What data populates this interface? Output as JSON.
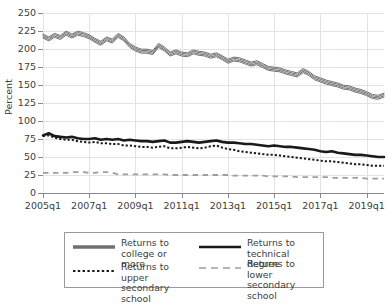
{
  "chart_data": {
    "type": "line",
    "title": "",
    "subtitle": "",
    "xlabel": "",
    "ylabel": "Percent",
    "ylim": [
      0,
      250
    ],
    "yticks": [
      0,
      25,
      50,
      75,
      100,
      125,
      150,
      175,
      200,
      225,
      250
    ],
    "xticks": [
      "2005q1",
      "2007q1",
      "2009q1",
      "2011q1",
      "2013q1",
      "2015q1",
      "2017q1",
      "2019q1"
    ],
    "x_start": "2005q1",
    "x_end": "2019q4",
    "grid": true,
    "legend_position": "below",
    "colors": {
      "college": "#707070",
      "technical": "#1a1a1a",
      "upper_secondary": "#1a1a1a",
      "lower_secondary": "#9e9e9e",
      "grid": "#e2e2e8",
      "axis": "#8a8a8a",
      "text": "#3d3d3d",
      "background": "#ffffff"
    },
    "series": [
      {
        "name": "Returns to college or more",
        "legend_label": "Returns to\ncollege or more",
        "style": "solid",
        "color": "#707070",
        "width": 4,
        "values": [
          218,
          214,
          219,
          216,
          222,
          218,
          222,
          220,
          217,
          212,
          208,
          214,
          211,
          219,
          214,
          205,
          200,
          197,
          197,
          195,
          205,
          200,
          193,
          196,
          193,
          192,
          196,
          194,
          193,
          190,
          192,
          188,
          183,
          186,
          185,
          182,
          179,
          181,
          177,
          173,
          172,
          171,
          168,
          166,
          164,
          170,
          166,
          160,
          157,
          154,
          152,
          150,
          147,
          146,
          143,
          141,
          138,
          134,
          133,
          136
        ]
      },
      {
        "name": "Returns to technical degree",
        "legend_label": "Returns to\ntechnical degree",
        "style": "solid",
        "color": "#1a1a1a",
        "width": 2.6,
        "values": [
          80,
          83,
          79,
          78,
          77,
          78,
          76,
          75,
          75,
          76,
          74,
          75,
          74,
          75,
          73,
          74,
          73,
          72,
          72,
          71,
          72,
          73,
          70,
          70,
          71,
          72,
          71,
          70,
          71,
          72,
          73,
          71,
          70,
          70,
          69,
          68,
          68,
          67,
          66,
          65,
          66,
          65,
          64,
          64,
          63,
          62,
          61,
          60,
          58,
          57,
          58,
          56,
          55,
          54,
          53,
          53,
          52,
          51,
          50,
          50
        ]
      },
      {
        "name": "Returns to upper secondary school",
        "legend_label": "Returns to upper\nsecondary school",
        "style": "dotted",
        "color": "#1a1a1a",
        "width": 2.0,
        "values": [
          79,
          80,
          77,
          75,
          74,
          74,
          72,
          71,
          70,
          71,
          69,
          69,
          68,
          68,
          66,
          66,
          65,
          64,
          64,
          63,
          64,
          65,
          62,
          62,
          63,
          64,
          63,
          62,
          63,
          65,
          66,
          63,
          61,
          60,
          58,
          57,
          56,
          55,
          54,
          53,
          53,
          52,
          51,
          50,
          49,
          48,
          47,
          46,
          45,
          44,
          44,
          43,
          42,
          41,
          40,
          40,
          39,
          38,
          38,
          38
        ]
      },
      {
        "name": "Returns to lower secondary school",
        "legend_label": "Returns to lower\nsecondary school",
        "style": "dashed",
        "color": "#9e9e9e",
        "width": 1.8,
        "values": [
          28,
          28,
          28,
          28,
          28,
          29,
          29,
          29,
          28,
          28,
          29,
          29,
          28,
          26,
          26,
          26,
          26,
          26,
          26,
          26,
          26,
          26,
          25,
          25,
          25,
          25,
          25,
          25,
          25,
          25,
          25,
          25,
          25,
          24,
          24,
          24,
          24,
          24,
          24,
          23,
          23,
          23,
          23,
          23,
          22,
          22,
          22,
          22,
          22,
          22,
          21,
          21,
          21,
          21,
          21,
          21,
          20,
          20,
          20,
          20
        ]
      }
    ]
  },
  "legend": {
    "entries": [
      {
        "label": "Returns to\ncollege or more",
        "style": "solid-thick-gray"
      },
      {
        "label": "Returns to\ntechnical degree",
        "style": "solid-thick-black"
      },
      {
        "label": "Returns to upper\nsecondary school",
        "style": "dotted-black"
      },
      {
        "label": "Returns to lower\nsecondary school",
        "style": "dashed-gray"
      }
    ]
  }
}
